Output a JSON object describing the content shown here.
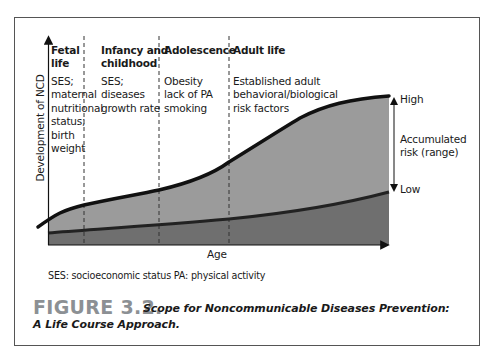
{
  "diagram": {
    "y_axis_label": "Development of NCD",
    "x_axis_label": "Age",
    "stages": [
      {
        "heading": [
          "Fetal",
          "life"
        ],
        "factors": [
          "SES;",
          "maternal",
          "nutritional",
          "status;",
          "birth",
          "weight"
        ]
      },
      {
        "heading": [
          "Infancy and",
          "childhood"
        ],
        "factors": [
          "SES;",
          "diseases",
          "growth rate"
        ]
      },
      {
        "heading": [
          "Adolescence"
        ],
        "factors": [
          "Obesity",
          "lack of PA",
          "smoking"
        ]
      },
      {
        "heading": [
          "Adult life"
        ],
        "factors": [
          "Established adult",
          "behavioral/biological",
          "risk factors"
        ]
      }
    ],
    "range_labels": {
      "high": "High",
      "low": "Low",
      "accumulated": [
        "Accumulated",
        "risk (range)"
      ]
    },
    "colors": {
      "upper_fill": "#9b9b9b",
      "lower_fill": "#6f6f6f",
      "curve": "#111111"
    }
  },
  "footnote": "SES: socioeconomic status  PA: physical activity",
  "caption": {
    "number": "FIGURE 3.2.",
    "title_line1": "Scope for Noncommunicable Diseases Prevention:",
    "title_line2": "A Life Course Approach."
  }
}
